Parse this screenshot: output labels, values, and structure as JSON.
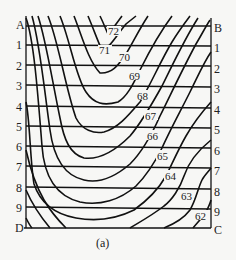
{
  "figure": {
    "caption": "(a)",
    "corners": {
      "top_left": "A",
      "top_right": "B",
      "bottom_left": "D",
      "bottom_right": "C"
    },
    "row_labels": [
      "A",
      "1",
      "2",
      "3",
      "4",
      "5",
      "6",
      "7",
      "8",
      "9",
      "D"
    ],
    "right_labels": [
      "B",
      "1",
      "2",
      "3",
      "4",
      "5",
      "6",
      "7",
      "8",
      "9",
      "C"
    ],
    "contour_labels": [
      "72",
      "71",
      "70",
      "69",
      "68",
      "67",
      "66",
      "65",
      "64",
      "63",
      "62"
    ],
    "line_color": "#111111",
    "background": "#f7f7f5"
  }
}
